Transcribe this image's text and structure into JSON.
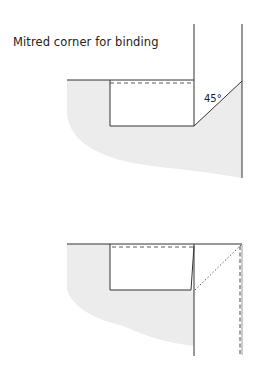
{
  "title": "Mitred corner for binding",
  "annotations": {
    "angle": "45°"
  },
  "figures": [
    {
      "name": "mitre-step-1",
      "description": "Binding folded up at 45° forming mitre"
    },
    {
      "name": "mitre-step-2",
      "description": "Binding folded back down over the fold"
    }
  ],
  "colors": {
    "line": "#333333",
    "fill": "#ececec",
    "background": "#ffffff"
  }
}
